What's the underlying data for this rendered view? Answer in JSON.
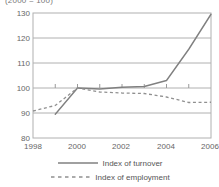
{
  "chart_data": {
    "type": "line",
    "title": "(2000 = 100)",
    "xlabel": "",
    "ylabel": "",
    "xlim": [
      1998,
      2006
    ],
    "ylim": [
      80,
      130
    ],
    "yticks": [
      80,
      90,
      100,
      110,
      120,
      130
    ],
    "xticks": [
      1998,
      1999,
      2000,
      2001,
      2002,
      2003,
      2004,
      2005,
      2006
    ],
    "xtick_labels": [
      "1998",
      "",
      "2000",
      "",
      "2002",
      "",
      "2004",
      "",
      "2006"
    ],
    "grid": true,
    "legend_position": "bottom",
    "x": [
      1998,
      1999,
      2000,
      2001,
      2002,
      2003,
      2004,
      2005,
      2006
    ],
    "series": [
      {
        "name": "Index of turnover",
        "style": "solid",
        "color": "#808080",
        "x": [
          1999,
          2000,
          2001,
          2002,
          2003,
          2004,
          2005,
          2006
        ],
        "values": [
          89.5,
          100.0,
          99.6,
          100.3,
          100.6,
          103.0,
          115.5,
          129.5
        ]
      },
      {
        "name": "Index of employment",
        "style": "dashed",
        "color": "#909090",
        "x": [
          1998,
          1999,
          2000,
          2001,
          2002,
          2003,
          2004,
          2005,
          2006
        ],
        "values": [
          90.8,
          93.0,
          100.0,
          98.4,
          98.0,
          97.8,
          96.4,
          94.2,
          94.3
        ]
      }
    ]
  },
  "axis": {
    "y_labels": [
      "130",
      "120",
      "110",
      "100",
      "90",
      "80"
    ],
    "x_labels": [
      "1998",
      "2000",
      "2002",
      "2004",
      "2006"
    ]
  },
  "legend": {
    "items": [
      {
        "label": "Index of turnover",
        "style": "solid"
      },
      {
        "label": "Index of employment",
        "style": "dashed"
      }
    ]
  }
}
